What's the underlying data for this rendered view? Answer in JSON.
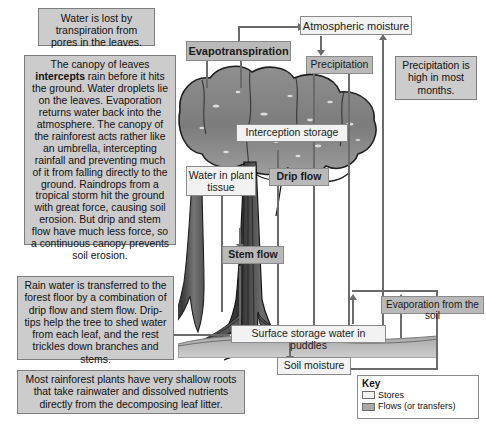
{
  "diagram": {
    "notes": [
      {
        "id": "transpiration-note",
        "text": "Water is lost by transpiration from pores in the leaves."
      },
      {
        "id": "canopy-note",
        "text_before_bold": "The canopy of leaves ",
        "bold": "intercepts",
        "text_after_bold": " rain before it hits the ground. Water droplets lie on the leaves. Evaporation returns water back into the atmosphere. The canopy of the rainforest acts rather like an umbrella, intercepting rainfall and preventing much of it from falling directly to the ground. Raindrops from a tropical storm hit the ground with great force, causing soil erosion. But drip and stem flow have much less force, so a continuous canopy prevents soil erosion."
      },
      {
        "id": "drip-stem-note",
        "text": "Rain water is transferred to the forest floor by a combination of drip flow and stem flow. Drip-tips help the tree to shed water from each leaf, and the rest trickles down branches and stems."
      },
      {
        "id": "roots-note",
        "text": "Most rainforest plants have very shallow roots that take rainwater and dissolved nutrients directly from the decomposing leaf litter."
      },
      {
        "id": "precipitation-note",
        "text": "Precipitation is high in most months."
      }
    ],
    "stores": [
      {
        "id": "atmospheric-moisture",
        "label": "Atmospheric moisture"
      },
      {
        "id": "interception-storage",
        "label": "Interception storage"
      },
      {
        "id": "water-in-plant-tissue",
        "label": "Water in plant tissue"
      },
      {
        "id": "surface-storage",
        "label": "Surface storage water in puddles"
      },
      {
        "id": "soil-moisture",
        "label": "Soil moisture"
      }
    ],
    "flows": [
      {
        "id": "evapotranspiration",
        "label": "Evapotranspiration"
      },
      {
        "id": "precipitation",
        "label": "Precipitation"
      },
      {
        "id": "drip-flow",
        "label": "Drip flow"
      },
      {
        "id": "stem-flow",
        "label": "Stem flow"
      },
      {
        "id": "evaporation-from-soil",
        "label": "Evaporation from the soil"
      }
    ],
    "key": {
      "title": "Key",
      "stores_label": "Stores",
      "flows_label": "Flows (or transfers)"
    },
    "colors": {
      "store_fill": "#f2f2f2",
      "flow_fill": "#b9b9b9",
      "note_fill": "#cccccc",
      "line": "#6b6b6b",
      "border": "#8a8a8a"
    }
  }
}
